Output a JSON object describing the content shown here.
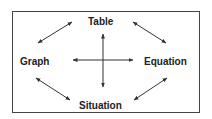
{
  "diagram": {
    "nodes": {
      "top": "Table",
      "left": "Graph",
      "right": "Equation",
      "bottom": "Situation"
    },
    "connections": [
      {
        "from": "Table",
        "to": "Graph",
        "type": "bidirectional"
      },
      {
        "from": "Table",
        "to": "Equation",
        "type": "bidirectional"
      },
      {
        "from": "Graph",
        "to": "Situation",
        "type": "bidirectional"
      },
      {
        "from": "Equation",
        "to": "Situation",
        "type": "bidirectional"
      },
      {
        "from": "Table",
        "to": "Situation",
        "type": "bidirectional"
      },
      {
        "from": "Graph",
        "to": "Equation",
        "type": "bidirectional"
      }
    ],
    "colors": {
      "stroke": "#333333",
      "text": "#222222",
      "background": "#ffffff"
    }
  }
}
